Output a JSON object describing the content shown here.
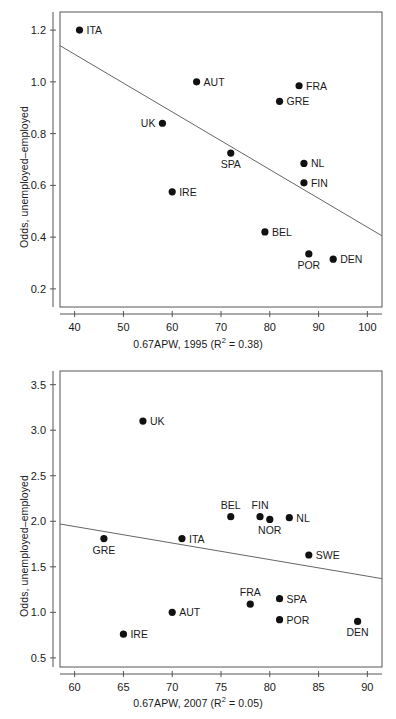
{
  "figure": {
    "background": "#ffffff",
    "point_color": "#111111",
    "line_color": "#666666",
    "axis_color": "#555555",
    "text_color": "#1a1a1a"
  },
  "charts": [
    {
      "id": "chart-1995",
      "ylabel": "Odds, unemployed–employed",
      "xlabel_prefix": "0.67APW, 1995 (R",
      "xlabel_sup": "2",
      "xlabel_suffix": " = 0.38)"
    },
    {
      "id": "chart-2007",
      "ylabel": "Odds, unemployed–employed",
      "xlabel_prefix": "0.67APW, 2007 (R",
      "xlabel_sup": "2",
      "xlabel_suffix": " = 0.05)"
    }
  ],
  "chart_data": [
    {
      "type": "scatter",
      "title": "",
      "xlabel": "0.67APW, 1995 (R2 = 0.38)",
      "ylabel": "Odds, unemployed–employed",
      "r_squared": 0.38,
      "year": 1995,
      "xlim": [
        37,
        103
      ],
      "ylim": [
        0.13,
        1.27
      ],
      "xticks": [
        40,
        50,
        60,
        70,
        80,
        90,
        100
      ],
      "xticklabels": [
        "40",
        "50",
        "60",
        "70",
        "80",
        "90",
        "100"
      ],
      "yticks": [
        0.2,
        0.4,
        0.6,
        0.8,
        1.0,
        1.2
      ],
      "yticklabels": [
        "0.2",
        "0.4",
        "0.6",
        "0.8",
        "1.0",
        "1.2"
      ],
      "grid": false,
      "legend": "none",
      "trendline": {
        "x": [
          37,
          103
        ],
        "y": [
          1.14,
          0.405
        ]
      },
      "points": [
        {
          "label": "ITA",
          "x": 41,
          "y": 1.2,
          "label_pos": "right"
        },
        {
          "label": "AUT",
          "x": 65,
          "y": 1.0,
          "label_pos": "right"
        },
        {
          "label": "FRA",
          "x": 86,
          "y": 0.985,
          "label_pos": "right"
        },
        {
          "label": "GRE",
          "x": 82,
          "y": 0.925,
          "label_pos": "right"
        },
        {
          "label": "UK",
          "x": 58,
          "y": 0.84,
          "label_pos": "left"
        },
        {
          "label": "SPA",
          "x": 72,
          "y": 0.725,
          "label_pos": "below"
        },
        {
          "label": "NL",
          "x": 87,
          "y": 0.685,
          "label_pos": "right"
        },
        {
          "label": "FIN",
          "x": 87,
          "y": 0.61,
          "label_pos": "right"
        },
        {
          "label": "IRE",
          "x": 60,
          "y": 0.575,
          "label_pos": "right"
        },
        {
          "label": "BEL",
          "x": 79,
          "y": 0.42,
          "label_pos": "right"
        },
        {
          "label": "POR",
          "x": 88,
          "y": 0.335,
          "label_pos": "below"
        },
        {
          "label": "DEN",
          "x": 93,
          "y": 0.315,
          "label_pos": "right"
        }
      ]
    },
    {
      "type": "scatter",
      "title": "",
      "xlabel": "0.67APW, 2007 (R2 = 0.05)",
      "ylabel": "Odds, unemployed–employed",
      "r_squared": 0.05,
      "year": 2007,
      "xlim": [
        58.5,
        91.5
      ],
      "ylim": [
        0.4,
        3.65
      ],
      "xticks": [
        60,
        65,
        70,
        75,
        80,
        85,
        90
      ],
      "xticklabels": [
        "60",
        "65",
        "70",
        "75",
        "80",
        "85",
        "90"
      ],
      "yticks": [
        0.5,
        1.0,
        1.5,
        2.0,
        2.5,
        3.0,
        3.5
      ],
      "yticklabels": [
        "0.5",
        "1.0",
        "1.5",
        "2.0",
        "2.5",
        "3.0",
        "3.5"
      ],
      "grid": false,
      "legend": "none",
      "trendline": {
        "x": [
          58.5,
          91.5
        ],
        "y": [
          1.97,
          1.37
        ]
      },
      "points": [
        {
          "label": "UK",
          "x": 67,
          "y": 3.1,
          "label_pos": "right"
        },
        {
          "label": "BEL",
          "x": 76,
          "y": 2.05,
          "label_pos": "above"
        },
        {
          "label": "FIN",
          "x": 79,
          "y": 2.05,
          "label_pos": "above"
        },
        {
          "label": "NOR",
          "x": 80,
          "y": 2.02,
          "label_pos": "below"
        },
        {
          "label": "NL",
          "x": 82,
          "y": 2.04,
          "label_pos": "right"
        },
        {
          "label": "GRE",
          "x": 63,
          "y": 1.81,
          "label_pos": "below"
        },
        {
          "label": "ITA",
          "x": 71,
          "y": 1.81,
          "label_pos": "right"
        },
        {
          "label": "SWE",
          "x": 84,
          "y": 1.63,
          "label_pos": "right"
        },
        {
          "label": "SPA",
          "x": 81,
          "y": 1.15,
          "label_pos": "right"
        },
        {
          "label": "FRA",
          "x": 78,
          "y": 1.09,
          "label_pos": "above"
        },
        {
          "label": "AUT",
          "x": 70,
          "y": 1.0,
          "label_pos": "right"
        },
        {
          "label": "POR",
          "x": 81,
          "y": 0.92,
          "label_pos": "right"
        },
        {
          "label": "DEN",
          "x": 89,
          "y": 0.9,
          "label_pos": "below"
        },
        {
          "label": "IRE",
          "x": 65,
          "y": 0.76,
          "label_pos": "right"
        }
      ]
    }
  ]
}
